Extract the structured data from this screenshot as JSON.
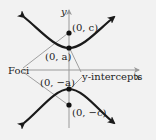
{
  "diagram": {
    "type": "hyperbola-vertical-transverse-axis",
    "background": "#f2f2f2",
    "curve_color": "#1a1a1a",
    "axis_color": "#9a9a9a",
    "leader_color": "#8a8a8a",
    "axes": {
      "x_label": "x",
      "y_label": "y"
    },
    "points": [
      {
        "id": "focus-top",
        "label": "(0, c)"
      },
      {
        "id": "vertex-top",
        "label": "(0, a)"
      },
      {
        "id": "vertex-bottom",
        "label": "(0, −a)"
      },
      {
        "id": "focus-bottom",
        "label": "(0, −c)"
      }
    ],
    "annotations": {
      "foci": "Foci",
      "y_intercepts": "y-intercepts"
    }
  }
}
